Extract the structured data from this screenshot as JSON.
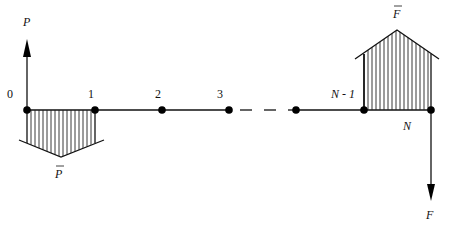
{
  "figure": {
    "type": "bar-chain load diagram",
    "colors": {
      "ink": "#111111",
      "background": "#ffffff"
    }
  },
  "nodes": [
    {
      "id": "node-0",
      "label": "0",
      "x": 27
    },
    {
      "id": "node-1",
      "label": "1",
      "x": 95
    },
    {
      "id": "node-2",
      "label": "2",
      "x": 162
    },
    {
      "id": "node-3",
      "label": "3",
      "x": 229
    },
    {
      "id": "node-n-2",
      "label": "",
      "x": 296
    },
    {
      "id": "node-n-1",
      "label": "N - 1",
      "x": 363
    },
    {
      "id": "node-n",
      "label": "N",
      "x": 431
    }
  ],
  "labels": {
    "node0": "0",
    "node1": "1",
    "node2": "2",
    "node3": "3",
    "nodeNm1": "N - 1",
    "nodeN": "N",
    "force_P": "P",
    "force_P_bar": "P",
    "force_F": "F",
    "force_F_bar": "F"
  },
  "forces": {
    "P": {
      "direction": "up",
      "at_node": "0"
    },
    "F": {
      "direction": "down",
      "at_node": "N"
    },
    "P_bar": {
      "type": "distributed load diagram",
      "span": "0-1",
      "side": "below"
    },
    "F_bar": {
      "type": "distributed load diagram",
      "span": "N-1 to N",
      "side": "above"
    }
  }
}
